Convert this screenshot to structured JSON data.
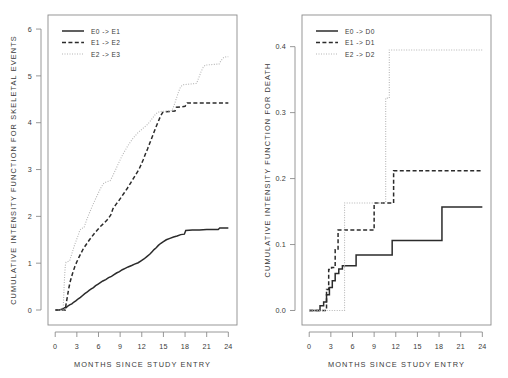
{
  "figure": {
    "width": 508,
    "height": 378,
    "background": "#ffffff",
    "ink_color": "#2b2b2b",
    "axis_color": "#8c8c8c",
    "faint_color": "#b5b5b5"
  },
  "chart_data": [
    {
      "id": "skeletal-events",
      "type": "line",
      "title": "",
      "xlabel": "MONTHS SINCE STUDY ENTRY",
      "ylabel": "CUMULATIVE INTENSITY FUNCTION FOR SKELETAL EVENTS",
      "xlim": [
        -1.0,
        25.2
      ],
      "ylim": [
        -0.32,
        6.3
      ],
      "xticks": [
        0,
        3,
        6,
        9,
        12,
        15,
        18,
        21,
        24
      ],
      "xticklabels": [
        "0",
        "3",
        "6",
        "9",
        "12",
        "15",
        "18",
        "21",
        "24"
      ],
      "yticks": [
        0,
        1,
        2,
        3,
        4,
        5,
        6
      ],
      "yticklabels": [
        "0",
        "1",
        "2",
        "3",
        "4",
        "5",
        "6"
      ],
      "grid": false,
      "legend_position": "top-left",
      "series": [
        {
          "name": "E0 -> E1",
          "style": "solid",
          "points": [
            [
              0.0,
              0.0
            ],
            [
              0.6,
              0.0
            ],
            [
              0.9,
              0.02
            ],
            [
              1.1,
              0.03
            ],
            [
              1.3,
              0.05
            ],
            [
              1.5,
              0.05
            ],
            [
              1.8,
              0.09
            ],
            [
              2.0,
              0.11
            ],
            [
              2.3,
              0.13
            ],
            [
              2.6,
              0.17
            ],
            [
              2.9,
              0.2
            ],
            [
              3.2,
              0.24
            ],
            [
              3.5,
              0.27
            ],
            [
              3.8,
              0.31
            ],
            [
              4.1,
              0.35
            ],
            [
              4.4,
              0.38
            ],
            [
              4.7,
              0.42
            ],
            [
              5.0,
              0.45
            ],
            [
              5.3,
              0.48
            ],
            [
              5.6,
              0.52
            ],
            [
              5.9,
              0.55
            ],
            [
              6.2,
              0.58
            ],
            [
              6.6,
              0.62
            ],
            [
              7.0,
              0.65
            ],
            [
              7.4,
              0.69
            ],
            [
              7.8,
              0.72
            ],
            [
              8.1,
              0.75
            ],
            [
              8.5,
              0.79
            ],
            [
              8.9,
              0.82
            ],
            [
              9.3,
              0.86
            ],
            [
              9.7,
              0.89
            ],
            [
              10.1,
              0.92
            ],
            [
              10.6,
              0.95
            ],
            [
              11.0,
              0.98
            ],
            [
              11.5,
              1.01
            ],
            [
              11.9,
              1.05
            ],
            [
              12.3,
              1.09
            ],
            [
              12.7,
              1.14
            ],
            [
              13.1,
              1.19
            ],
            [
              13.4,
              1.24
            ],
            [
              13.7,
              1.29
            ],
            [
              14.0,
              1.33
            ],
            [
              14.3,
              1.38
            ],
            [
              14.6,
              1.42
            ],
            [
              15.0,
              1.46
            ],
            [
              15.4,
              1.5
            ],
            [
              15.9,
              1.53
            ],
            [
              16.4,
              1.56
            ],
            [
              16.9,
              1.58
            ],
            [
              17.4,
              1.61
            ],
            [
              17.9,
              1.62
            ],
            [
              18.1,
              1.7
            ],
            [
              19.0,
              1.71
            ],
            [
              20.0,
              1.71
            ],
            [
              21.0,
              1.72
            ],
            [
              22.0,
              1.72
            ],
            [
              22.6,
              1.72
            ],
            [
              22.8,
              1.75
            ],
            [
              24.0,
              1.75
            ]
          ]
        },
        {
          "name": "E1 -> E2",
          "style": "dashed",
          "points": [
            [
              0.0,
              0.0
            ],
            [
              1.4,
              0.0
            ],
            [
              1.5,
              0.12
            ],
            [
              1.7,
              0.3
            ],
            [
              1.9,
              0.48
            ],
            [
              2.1,
              0.62
            ],
            [
              2.4,
              0.78
            ],
            [
              2.7,
              0.92
            ],
            [
              3.0,
              1.03
            ],
            [
              3.3,
              1.13
            ],
            [
              3.6,
              1.22
            ],
            [
              3.9,
              1.31
            ],
            [
              4.3,
              1.4
            ],
            [
              4.7,
              1.49
            ],
            [
              5.1,
              1.57
            ],
            [
              5.5,
              1.65
            ],
            [
              5.9,
              1.72
            ],
            [
              6.3,
              1.79
            ],
            [
              6.8,
              1.86
            ],
            [
              7.3,
              1.94
            ],
            [
              7.7,
              2.03
            ],
            [
              8.0,
              2.16
            ],
            [
              8.4,
              2.25
            ],
            [
              8.8,
              2.33
            ],
            [
              9.2,
              2.42
            ],
            [
              9.6,
              2.51
            ],
            [
              10.0,
              2.6
            ],
            [
              10.4,
              2.7
            ],
            [
              10.8,
              2.8
            ],
            [
              11.2,
              2.9
            ],
            [
              11.6,
              3.0
            ],
            [
              11.9,
              3.1
            ],
            [
              12.2,
              3.21
            ],
            [
              12.5,
              3.33
            ],
            [
              12.8,
              3.44
            ],
            [
              13.1,
              3.56
            ],
            [
              13.4,
              3.68
            ],
            [
              13.7,
              3.8
            ],
            [
              14.0,
              3.92
            ],
            [
              14.3,
              4.03
            ],
            [
              14.6,
              4.14
            ],
            [
              14.9,
              4.22
            ],
            [
              15.2,
              4.23
            ],
            [
              16.0,
              4.24
            ],
            [
              16.6,
              4.25
            ],
            [
              16.8,
              4.33
            ],
            [
              17.6,
              4.34
            ],
            [
              18.0,
              4.35
            ],
            [
              18.3,
              4.42
            ],
            [
              20.0,
              4.42
            ],
            [
              22.0,
              4.42
            ],
            [
              24.0,
              4.42
            ]
          ]
        },
        {
          "name": "E2 -> E3",
          "style": "dotted",
          "points": [
            [
              0.0,
              0.0
            ],
            [
              1.1,
              0.0
            ],
            [
              1.2,
              0.38
            ],
            [
              1.3,
              0.72
            ],
            [
              1.4,
              0.95
            ],
            [
              1.5,
              1.02
            ],
            [
              2.0,
              1.05
            ],
            [
              2.3,
              1.2
            ],
            [
              2.6,
              1.35
            ],
            [
              2.9,
              1.48
            ],
            [
              3.2,
              1.6
            ],
            [
              3.4,
              1.7
            ],
            [
              3.6,
              1.74
            ],
            [
              4.0,
              1.76
            ],
            [
              4.3,
              1.9
            ],
            [
              4.6,
              2.02
            ],
            [
              4.9,
              2.13
            ],
            [
              5.2,
              2.24
            ],
            [
              5.5,
              2.34
            ],
            [
              5.8,
              2.44
            ],
            [
              6.1,
              2.54
            ],
            [
              6.4,
              2.63
            ],
            [
              6.7,
              2.7
            ],
            [
              7.0,
              2.73
            ],
            [
              7.6,
              2.76
            ],
            [
              7.9,
              2.84
            ],
            [
              8.2,
              2.94
            ],
            [
              8.5,
              3.04
            ],
            [
              8.8,
              3.14
            ],
            [
              9.1,
              3.24
            ],
            [
              9.4,
              3.33
            ],
            [
              9.7,
              3.41
            ],
            [
              10.0,
              3.49
            ],
            [
              10.3,
              3.56
            ],
            [
              10.6,
              3.63
            ],
            [
              10.9,
              3.69
            ],
            [
              11.2,
              3.74
            ],
            [
              11.5,
              3.79
            ],
            [
              11.8,
              3.83
            ],
            [
              12.1,
              3.87
            ],
            [
              12.4,
              3.91
            ],
            [
              12.7,
              3.95
            ],
            [
              13.0,
              4.0
            ],
            [
              13.3,
              4.06
            ],
            [
              13.6,
              4.12
            ],
            [
              13.9,
              4.18
            ],
            [
              14.2,
              4.22
            ],
            [
              14.6,
              4.24
            ],
            [
              15.6,
              4.25
            ],
            [
              16.2,
              4.26
            ],
            [
              16.5,
              4.38
            ],
            [
              16.8,
              4.52
            ],
            [
              17.1,
              4.66
            ],
            [
              17.4,
              4.77
            ],
            [
              17.7,
              4.81
            ],
            [
              18.3,
              4.82
            ],
            [
              19.0,
              4.83
            ],
            [
              19.6,
              4.84
            ],
            [
              19.9,
              4.96
            ],
            [
              20.2,
              5.08
            ],
            [
              20.5,
              5.18
            ],
            [
              20.8,
              5.23
            ],
            [
              21.6,
              5.24
            ],
            [
              22.4,
              5.25
            ],
            [
              22.7,
              5.25
            ],
            [
              23.0,
              5.33
            ],
            [
              23.4,
              5.4
            ],
            [
              24.0,
              5.41
            ]
          ]
        }
      ]
    },
    {
      "id": "death",
      "type": "line",
      "title": "",
      "xlabel": "MONTHS SINCE STUDY ENTRY",
      "ylabel": "CUMULATIVE INTENSITY FUNCTION FOR DEATH",
      "xlim": [
        -1.0,
        25.2
      ],
      "ylim": [
        -0.022,
        0.448
      ],
      "xticks": [
        0,
        3,
        6,
        9,
        12,
        15,
        18,
        21,
        24
      ],
      "xticklabels": [
        "0",
        "3",
        "6",
        "9",
        "12",
        "15",
        "18",
        "21",
        "24"
      ],
      "yticks": [
        0.0,
        0.1,
        0.2,
        0.3,
        0.4
      ],
      "yticklabels": [
        "0.0",
        "0.1",
        "0.2",
        "0.3",
        "0.4"
      ],
      "grid": false,
      "legend_position": "top-left",
      "series": [
        {
          "name": "E0 -> D0",
          "style": "solid",
          "points": [
            [
              0.0,
              0.0
            ],
            [
              1.5,
              0.0
            ],
            [
              1.5,
              0.007
            ],
            [
              2.0,
              0.007
            ],
            [
              2.0,
              0.013
            ],
            [
              2.4,
              0.013
            ],
            [
              2.4,
              0.024
            ],
            [
              2.8,
              0.024
            ],
            [
              2.8,
              0.035
            ],
            [
              3.2,
              0.035
            ],
            [
              3.2,
              0.045
            ],
            [
              3.6,
              0.045
            ],
            [
              3.6,
              0.056
            ],
            [
              4.1,
              0.056
            ],
            [
              4.1,
              0.063
            ],
            [
              4.6,
              0.063
            ],
            [
              4.6,
              0.068
            ],
            [
              6.5,
              0.068
            ],
            [
              6.5,
              0.084
            ],
            [
              11.5,
              0.084
            ],
            [
              11.5,
              0.106
            ],
            [
              18.4,
              0.106
            ],
            [
              18.4,
              0.157
            ],
            [
              24.0,
              0.157
            ]
          ]
        },
        {
          "name": "E1 -> D1",
          "style": "dashed",
          "points": [
            [
              0.0,
              0.0
            ],
            [
              2.4,
              0.0
            ],
            [
              2.4,
              0.032
            ],
            [
              2.7,
              0.032
            ],
            [
              2.7,
              0.062
            ],
            [
              3.1,
              0.062
            ],
            [
              3.1,
              0.065
            ],
            [
              3.6,
              0.065
            ],
            [
              3.6,
              0.092
            ],
            [
              4.0,
              0.092
            ],
            [
              4.0,
              0.122
            ],
            [
              9.0,
              0.122
            ],
            [
              9.0,
              0.163
            ],
            [
              11.7,
              0.163
            ],
            [
              11.7,
              0.212
            ],
            [
              24.0,
              0.212
            ]
          ]
        },
        {
          "name": "E2 -> D2",
          "style": "dotted",
          "points": [
            [
              0.0,
              0.0
            ],
            [
              4.9,
              0.0
            ],
            [
              4.9,
              0.163
            ],
            [
              10.6,
              0.163
            ],
            [
              10.6,
              0.322
            ],
            [
              11.1,
              0.322
            ],
            [
              11.1,
              0.395
            ],
            [
              24.0,
              0.395
            ]
          ]
        }
      ]
    }
  ]
}
